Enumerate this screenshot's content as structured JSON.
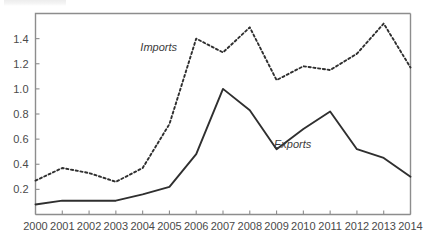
{
  "chart_data": {
    "type": "line",
    "title": "",
    "subtitle": "",
    "xlabel": "",
    "ylabel": "",
    "categories": [
      "2000",
      "2001",
      "2002",
      "2003",
      "2004",
      "2005",
      "2006",
      "2007",
      "2008",
      "2009",
      "2010",
      "2011",
      "2012",
      "2013",
      "2014"
    ],
    "x": [
      2000,
      2001,
      2002,
      2003,
      2004,
      2005,
      2006,
      2007,
      2008,
      2009,
      2010,
      2011,
      2012,
      2013,
      2014
    ],
    "series": [
      {
        "name": "Imports",
        "style": "dotted",
        "values": [
          0.27,
          0.37,
          0.33,
          0.26,
          0.37,
          0.72,
          1.4,
          1.29,
          1.49,
          1.07,
          1.18,
          1.15,
          1.28,
          1.52,
          1.17
        ]
      },
      {
        "name": "Exports",
        "style": "solid",
        "values": [
          0.08,
          0.11,
          0.11,
          0.11,
          0.16,
          0.22,
          0.48,
          1.0,
          0.83,
          0.52,
          0.68,
          0.82,
          0.52,
          0.45,
          0.3
        ]
      }
    ],
    "ylim": [
      0.0,
      1.6
    ],
    "xlim": [
      2000,
      2014
    ],
    "yticks": [
      0.2,
      0.4,
      0.6,
      0.8,
      1.0,
      1.2,
      1.4
    ],
    "ytick_labels": [
      "0.2",
      "0.4",
      "0.6",
      "0.8",
      "1.0",
      "1.2",
      "1.4"
    ],
    "xtick_labels": [
      "2000",
      "2001",
      "2002",
      "2003",
      "2004",
      "2005",
      "2006",
      "2007",
      "2008",
      "2009",
      "2010",
      "2011",
      "2012",
      "2013",
      "2014"
    ],
    "grid": false,
    "legend_position": "inline-annotations",
    "annotations": [
      {
        "text": "Imports",
        "x": 2004.6,
        "y": 1.3
      },
      {
        "text": "Exports",
        "x": 2009.6,
        "y": 0.53
      }
    ],
    "colors": {
      "series_line": "#2f2f2f",
      "axis": "#8d8d8d",
      "tick_text": "#4a4a4a",
      "background": "#ffffff"
    }
  }
}
